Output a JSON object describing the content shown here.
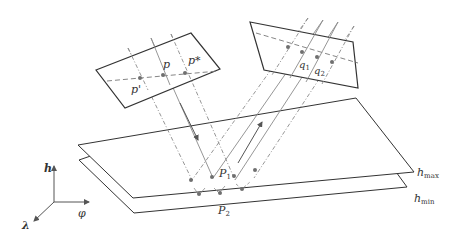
{
  "diagram": {
    "colors": {
      "frame": "#333333",
      "ray": "#8a8a8a",
      "point": "#6f6f6f",
      "text": "#333333"
    },
    "left_image": {
      "points": [
        "p'",
        "p",
        "p*"
      ],
      "label_p_prime": "p'",
      "label_p": "p",
      "label_p_star": "p*"
    },
    "right_image": {
      "label_q1": "q",
      "label_q1_sub": "1",
      "label_q2": "q",
      "label_q2_sub": "2"
    },
    "planes": {
      "upper": {
        "label": "h",
        "label_sub": "max"
      },
      "lower": {
        "label": "h",
        "label_sub": "min"
      }
    },
    "intersections": {
      "P1": {
        "label": "P",
        "sub": "1"
      },
      "P2": {
        "label": "P",
        "sub": "2"
      }
    },
    "axes": {
      "up": "h",
      "right": "φ",
      "diag": "λ"
    }
  }
}
